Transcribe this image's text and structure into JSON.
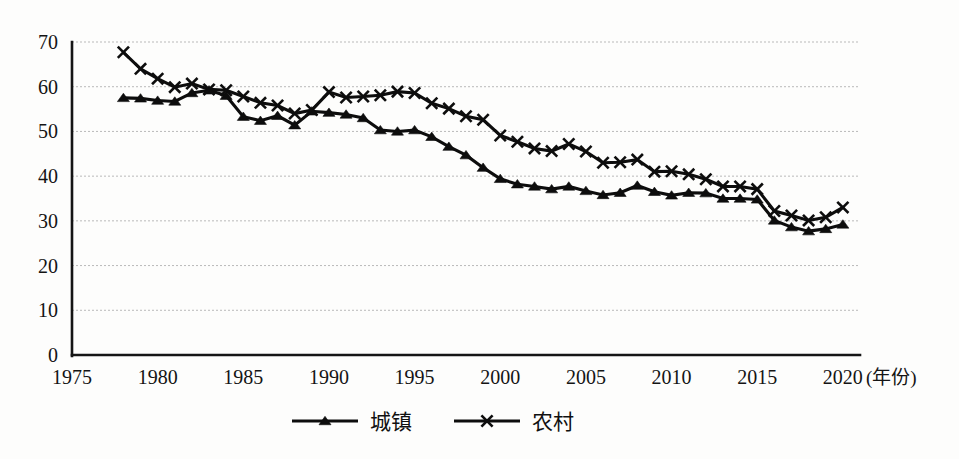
{
  "chart_data": {
    "type": "line",
    "title": "",
    "subtitle": "",
    "xlabel": "(年份)",
    "ylabel": "",
    "xlim": [
      1975,
      2021
    ],
    "ylim": [
      0,
      70
    ],
    "grid": true,
    "grid_style": "horizontal-dashed",
    "legend_position": "bottom-center",
    "x_ticks": [
      "1975",
      "1980",
      "1985",
      "1990",
      "1995",
      "2000",
      "2005",
      "2010",
      "2015",
      "2020"
    ],
    "x_tick_values": [
      1975,
      1980,
      1985,
      1990,
      1995,
      2000,
      2005,
      2010,
      2015,
      2020
    ],
    "y_ticks": [
      "0",
      "10",
      "20",
      "30",
      "40",
      "50",
      "60",
      "70"
    ],
    "y_tick_values": [
      0,
      10,
      20,
      30,
      40,
      50,
      60,
      70
    ],
    "x": [
      1978,
      1979,
      1980,
      1981,
      1982,
      1983,
      1984,
      1985,
      1986,
      1987,
      1988,
      1989,
      1990,
      1991,
      1992,
      1993,
      1994,
      1995,
      1996,
      1997,
      1998,
      1999,
      2000,
      2001,
      2002,
      2003,
      2004,
      2005,
      2006,
      2007,
      2008,
      2009,
      2010,
      2011,
      2012,
      2013,
      2014,
      2015,
      2016,
      2017,
      2018,
      2019,
      2020
    ],
    "series": [
      {
        "name": "城镇",
        "marker": "triangle",
        "values": [
          57.5,
          57.4,
          56.9,
          56.7,
          58.6,
          59.2,
          58.0,
          53.3,
          52.4,
          53.5,
          51.4,
          54.5,
          54.2,
          53.8,
          53.0,
          50.3,
          50.0,
          50.3,
          48.8,
          46.6,
          44.7,
          41.9,
          39.4,
          38.2,
          37.7,
          37.1,
          37.7,
          36.7,
          35.8,
          36.3,
          37.9,
          36.5,
          35.7,
          36.3,
          36.2,
          35.0,
          35.0,
          34.8,
          30.1,
          28.6,
          27.7,
          28.2,
          29.2
        ]
      },
      {
        "name": "农村",
        "marker": "x",
        "values": [
          67.7,
          64.0,
          61.8,
          59.9,
          60.7,
          59.4,
          59.2,
          57.8,
          56.4,
          55.8,
          54.0,
          54.8,
          58.8,
          57.6,
          57.8,
          58.1,
          58.9,
          58.6,
          56.3,
          55.1,
          53.4,
          52.6,
          49.1,
          47.7,
          46.2,
          45.6,
          47.2,
          45.5,
          43.0,
          43.1,
          43.7,
          41.0,
          41.1,
          40.4,
          39.3,
          37.7,
          37.7,
          37.1,
          32.2,
          31.2,
          30.1,
          30.8,
          33.0
        ]
      }
    ],
    "legend": [
      {
        "label": "城镇",
        "marker": "triangle"
      },
      {
        "label": "农村",
        "marker": "x"
      }
    ]
  }
}
